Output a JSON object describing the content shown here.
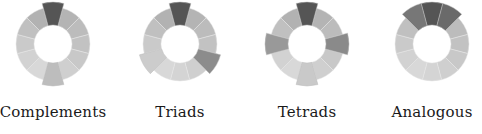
{
  "wheels": [
    {
      "id": "complements",
      "label": "Complements",
      "cx": 53,
      "cy": 44,
      "highlights": [
        {
          "index": 0,
          "color": "#555555"
        },
        {
          "index": 6,
          "color": "#bdbdbd"
        }
      ]
    },
    {
      "id": "triads",
      "label": "Triads",
      "cx": 180,
      "cy": 44,
      "highlights": [
        {
          "index": 0,
          "color": "#555555"
        },
        {
          "index": 4,
          "color": "#8c8c8c"
        },
        {
          "index": 8,
          "color": "#cccccc"
        }
      ]
    },
    {
      "id": "tetrads",
      "label": "Tetrads",
      "cx": 307,
      "cy": 44,
      "highlights": [
        {
          "index": 0,
          "color": "#555555"
        },
        {
          "index": 3,
          "color": "#8a8a8a"
        },
        {
          "index": 6,
          "color": "#c9c9c9"
        },
        {
          "index": 9,
          "color": "#999999"
        }
      ]
    },
    {
      "id": "analogous",
      "label": "Analogous",
      "cx": 432,
      "cy": 44,
      "highlights": [
        {
          "index": 11,
          "color": "#777777"
        },
        {
          "index": 0,
          "color": "#555555"
        },
        {
          "index": 1,
          "color": "#6a6a6a"
        }
      ]
    }
  ],
  "ring": {
    "segments": 12,
    "inner_radius": 19,
    "outer_radius": 37,
    "highlight_outer_radius": 42,
    "base_colors": [
      "#a8a8a8",
      "#b4b4b4",
      "#bcbcbc",
      "#c2c2c2",
      "#c8c8c8",
      "#cfcfcf",
      "#d4d4d4",
      "#d8d8d8",
      "#d2d2d2",
      "#cacaca",
      "#c0c0c0",
      "#b2b2b2"
    ],
    "stroke": "#ffffff"
  }
}
